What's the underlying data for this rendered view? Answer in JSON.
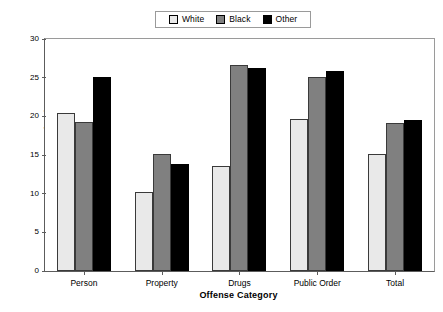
{
  "chart_data": {
    "type": "bar",
    "title": "",
    "xlabel": "Offense Category",
    "ylabel": "Percentage Detained",
    "categories": [
      "Person",
      "Property",
      "Drugs",
      "Public Order",
      "Total"
    ],
    "series": [
      {
        "name": "White",
        "color": "#e9e9e9",
        "values": [
          20.4,
          10.2,
          13.6,
          19.6,
          15.1
        ]
      },
      {
        "name": "Black",
        "color": "#808080",
        "values": [
          19.3,
          15.1,
          26.6,
          25.1,
          19.1
        ]
      },
      {
        "name": "Other",
        "color": "#000000",
        "values": [
          25.1,
          13.8,
          26.2,
          25.9,
          19.5
        ]
      }
    ],
    "ylim": [
      0,
      30
    ],
    "yticks": [
      0,
      5,
      10,
      15,
      20,
      25,
      30
    ],
    "ytick_labels": [
      "0",
      "5",
      "10",
      "15",
      "20",
      "25",
      "30"
    ],
    "grid": false,
    "legend_position": "top-center",
    "legend_entries": [
      "White",
      "Black",
      "Other"
    ]
  }
}
